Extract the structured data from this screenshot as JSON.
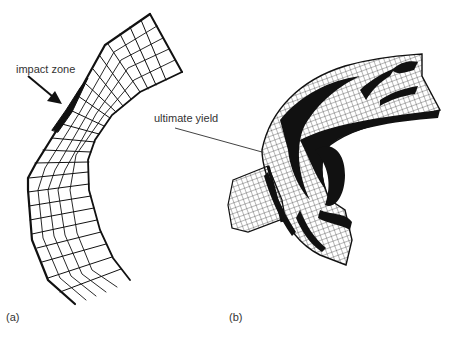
{
  "figure": {
    "panels": [
      {
        "id": "a",
        "caption": "(a)",
        "annotation": "impact zone",
        "description": "2D finite-element mesh of pipe bend with thickened impact zone on outer wall"
      },
      {
        "id": "b",
        "caption": "(b)",
        "annotation": "ultimate yield",
        "description": "3D deformed mesh of pipe elbow with dark yielded regions"
      }
    ],
    "colors": {
      "background": "#ffffff",
      "ink": "#111111",
      "text": "#333333"
    }
  }
}
